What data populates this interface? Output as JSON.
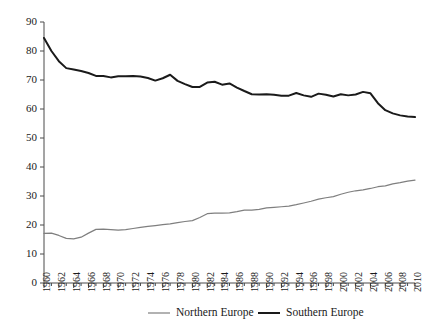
{
  "chart_data": {
    "type": "line",
    "title": "",
    "subtitle": "",
    "xlabel": "",
    "ylabel": "",
    "xlim": [
      1960,
      2010
    ],
    "ylim": [
      0,
      90
    ],
    "yticks": [
      0,
      10,
      20,
      30,
      40,
      50,
      60,
      70,
      80,
      90
    ],
    "xticks": [
      1960,
      1962,
      1964,
      1966,
      1968,
      1970,
      1972,
      1974,
      1976,
      1978,
      1980,
      1982,
      1984,
      1986,
      1988,
      1990,
      1992,
      1994,
      1996,
      1998,
      2000,
      2002,
      2004,
      2006,
      2008,
      2010
    ],
    "grid": false,
    "legend_position": "bottom",
    "x": [
      1960,
      1961,
      1962,
      1963,
      1964,
      1965,
      1966,
      1967,
      1968,
      1969,
      1970,
      1971,
      1972,
      1973,
      1974,
      1975,
      1976,
      1977,
      1978,
      1979,
      1980,
      1981,
      1982,
      1983,
      1984,
      1985,
      1986,
      1987,
      1988,
      1989,
      1990,
      1991,
      1992,
      1993,
      1994,
      1995,
      1996,
      1997,
      1998,
      1999,
      2000,
      2001,
      2002,
      2003,
      2004,
      2005,
      2006,
      2007,
      2008,
      2009,
      2010
    ],
    "series": [
      {
        "name": "Northern Europe",
        "color": "#7f7f7f",
        "width": 1.2,
        "values": [
          17.1,
          17.2,
          16.4,
          15.4,
          15.2,
          15.8,
          17.2,
          18.5,
          18.6,
          18.4,
          18.2,
          18.4,
          18.8,
          19.2,
          19.5,
          19.8,
          20.1,
          20.4,
          20.8,
          21.2,
          21.5,
          22.6,
          23.9,
          24.1,
          24.1,
          24.2,
          24.6,
          25.1,
          25.1,
          25.4,
          25.9,
          26.1,
          26.3,
          26.5,
          27.0,
          27.6,
          28.2,
          28.9,
          29.4,
          29.8,
          30.6,
          31.3,
          31.8,
          32.1,
          32.6,
          33.2,
          33.5,
          34.2,
          34.6,
          35.1,
          35.5
        ]
      },
      {
        "name": "Southern Europe",
        "color": "#1a1a1a",
        "width": 2.0,
        "values": [
          84.5,
          80.0,
          76.5,
          74.1,
          73.6,
          73.1,
          72.4,
          71.4,
          71.4,
          70.9,
          71.3,
          71.3,
          71.4,
          71.2,
          70.7,
          69.8,
          70.6,
          71.8,
          69.7,
          68.6,
          67.6,
          67.6,
          69.1,
          69.4,
          68.4,
          68.8,
          67.4,
          66.2,
          65.1,
          65.0,
          65.1,
          64.9,
          64.6,
          64.6,
          65.5,
          64.7,
          64.2,
          65.3,
          64.9,
          64.3,
          65.1,
          64.7,
          65.0,
          65.9,
          65.4,
          62.0,
          59.6,
          58.5,
          57.8,
          57.4,
          57.2
        ]
      }
    ]
  },
  "legend": {
    "items": [
      {
        "label": "Northern Europe"
      },
      {
        "label": "Southern Europe"
      }
    ]
  },
  "axes": {
    "y_tick_labels": [
      "0",
      "10",
      "20",
      "30",
      "40",
      "50",
      "60",
      "70",
      "80",
      "90"
    ],
    "x_tick_labels": [
      "1960",
      "1962",
      "1964",
      "1966",
      "1968",
      "1970",
      "1972",
      "1974",
      "1976",
      "1978",
      "1980",
      "1982",
      "1984",
      "1986",
      "1988",
      "1990",
      "1992",
      "1994",
      "1996",
      "1998",
      "2000",
      "2002",
      "2004",
      "2006",
      "2008",
      "2010"
    ]
  }
}
